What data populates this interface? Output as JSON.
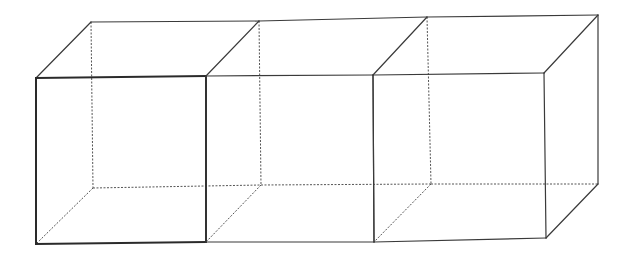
{
  "diagram": {
    "title": "",
    "colors": {
      "background": "#ffffff",
      "line": "#3a3a3a",
      "bold_line": "#2a2a2a",
      "hidden_line": "#555555"
    },
    "cubes": [
      {
        "id": "cube-1",
        "front": {
          "tl": [
            36,
            78
          ],
          "tr": [
            206,
            76
          ],
          "br": [
            206,
            242
          ],
          "bl": [
            36,
            244
          ]
        },
        "back": {
          "tl": [
            91,
            22
          ],
          "tr": [
            259,
            21
          ],
          "br": [
            261,
            185
          ],
          "bl": [
            93,
            188
          ]
        },
        "front_emphasized": true
      },
      {
        "id": "cube-2",
        "front": {
          "tl": [
            206,
            76
          ],
          "tr": [
            373,
            75
          ],
          "br": [
            374,
            242
          ],
          "bl": [
            206,
            242
          ]
        },
        "back": {
          "tl": [
            259,
            21
          ],
          "tr": [
            427,
            17
          ],
          "br": [
            431,
            184
          ],
          "bl": [
            261,
            185
          ]
        },
        "front_emphasized": false
      },
      {
        "id": "cube-3",
        "front": {
          "tl": [
            373,
            75
          ],
          "tr": [
            544,
            73
          ],
          "br": [
            546,
            238
          ],
          "bl": [
            374,
            242
          ]
        },
        "back": {
          "tl": [
            427,
            17
          ],
          "tr": [
            598,
            15
          ],
          "br": [
            598,
            184
          ],
          "bl": [
            431,
            184
          ]
        },
        "front_emphasized": false
      }
    ]
  }
}
